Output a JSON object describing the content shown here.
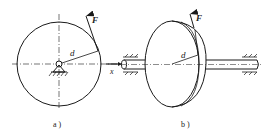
{
  "figure": {
    "panel_a": {
      "caption": "a )",
      "force_label": "F",
      "radius_label": "d",
      "axis_label": "x"
    },
    "panel_b": {
      "caption": "b )",
      "force_label": "F",
      "radius_label": "d"
    },
    "colors": {
      "line": "#1a1a1a",
      "background": "#ffffff"
    }
  }
}
